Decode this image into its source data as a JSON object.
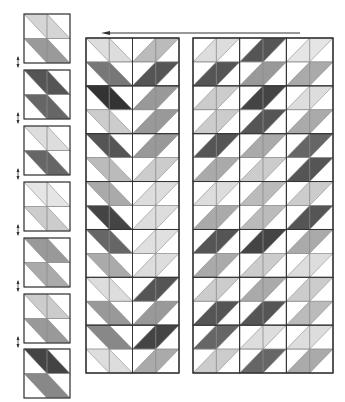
{
  "diagram": {
    "colors": {
      "background": "#ffffff",
      "cell_line": "#8a8a8a",
      "block_line": "#333333",
      "arrow": "#333333"
    },
    "top_arrow": {
      "x1": 300,
      "x2": 101,
      "y": 33,
      "direction": "left"
    },
    "side_arrows": {
      "x": 18,
      "ys": [
        62,
        118,
        174,
        230,
        286,
        342
      ],
      "direction": "vertical"
    },
    "small_blocks": {
      "x": 24,
      "width": 46,
      "height": 49,
      "ys": [
        14,
        70,
        126,
        182,
        238,
        294,
        349
      ],
      "orientation": "backslash",
      "shades": [
        [
          "#d5d5d5",
          "#9a9a9a"
        ],
        [
          "#555555",
          "#666666"
        ],
        [
          "#dddddd",
          "#666666"
        ],
        [
          "#e5e5e5",
          "#cccccc"
        ],
        [
          "#999999",
          "#aaaaaa"
        ],
        [
          "#cccccc",
          "#999999"
        ],
        [
          "#444444",
          "#888888"
        ]
      ]
    },
    "left_panel": {
      "x": 86,
      "y": 38,
      "width": 93,
      "height": 335,
      "rows": 14,
      "units_per_row": 2,
      "unit_orientations": [
        "backslash",
        "slash"
      ],
      "shades": [
        [
          "#dddddd",
          "#bbbbbb"
        ],
        [
          "#777777",
          "#555555"
        ],
        [
          "#333333",
          "#999999"
        ],
        [
          "#cccccc",
          "#999999"
        ],
        [
          "#555555",
          "#999999"
        ],
        [
          "#bbbbbb",
          "#cccccc"
        ],
        [
          "#aaaaaa",
          "#dddddd"
        ],
        [
          "#444444",
          "#dddddd"
        ],
        [
          "#666666",
          "#e0e0e0"
        ],
        [
          "#aaaaaa",
          "#dddddd"
        ],
        [
          "#dddddd",
          "#555555"
        ],
        [
          "#999999",
          "#999999"
        ],
        [
          "#888888",
          "#444444"
        ],
        [
          "#dddddd",
          "#aaaaaa"
        ]
      ]
    },
    "right_panel": {
      "x": 193,
      "y": 38,
      "width": 140,
      "height": 335,
      "rows": 14,
      "units_per_row": 3,
      "unit_orientations": [
        "slash",
        "slash",
        "slash"
      ],
      "shades": [
        [
          "#dddddd",
          "#555555",
          "#e5e5e5"
        ],
        [
          "#555555",
          "#999999",
          "#aaaaaa"
        ],
        [
          "#cccccc",
          "#444444",
          "#dddddd"
        ],
        [
          "#cccccc",
          "#555555",
          "#aaaaaa"
        ],
        [
          "#555555",
          "#aaaaaa",
          "#666666"
        ],
        [
          "#aaaaaa",
          "#cccccc",
          "#555555"
        ],
        [
          "#dddddd",
          "#bbbbbb",
          "#cccccc"
        ],
        [
          "#aaaaaa",
          "#bbbbbb",
          "#555555"
        ],
        [
          "#555555",
          "#444444",
          "#aaaaaa"
        ],
        [
          "#aaaaaa",
          "#cccccc",
          "#dddddd"
        ],
        [
          "#cccccc",
          "#aaaaaa",
          "#cccccc"
        ],
        [
          "#555555",
          "#555555",
          "#bbbbbb"
        ],
        [
          "#666666",
          "#dddddd",
          "#dddddd"
        ],
        [
          "#cccccc",
          "#666666",
          "#aaaaaa"
        ]
      ]
    }
  }
}
